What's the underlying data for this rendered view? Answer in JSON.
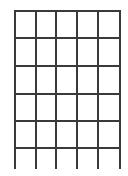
{
  "diagram": {
    "type": "grid",
    "line_color": "#3a3a3a",
    "background": "#ffffff",
    "columns": 5,
    "rows": 5,
    "vertical_lines_x": [
      14,
      35,
      55,
      76,
      97,
      119
    ],
    "horizontal_lines_y": [
      10,
      37,
      65,
      93,
      120,
      147
    ],
    "vertical_extent": [
      10,
      169
    ],
    "horizontal_extent": [
      14,
      121
    ]
  }
}
